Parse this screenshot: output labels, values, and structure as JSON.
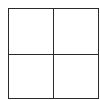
{
  "diagram": {
    "type": "grid",
    "rows": 2,
    "columns": 2,
    "line_color": "#2a2a2a",
    "background_color": "#ffffff",
    "cells": [
      {
        "row": 0,
        "col": 0,
        "label": ""
      },
      {
        "row": 0,
        "col": 1,
        "label": ""
      },
      {
        "row": 1,
        "col": 0,
        "label": ""
      },
      {
        "row": 1,
        "col": 1,
        "label": ""
      }
    ]
  }
}
